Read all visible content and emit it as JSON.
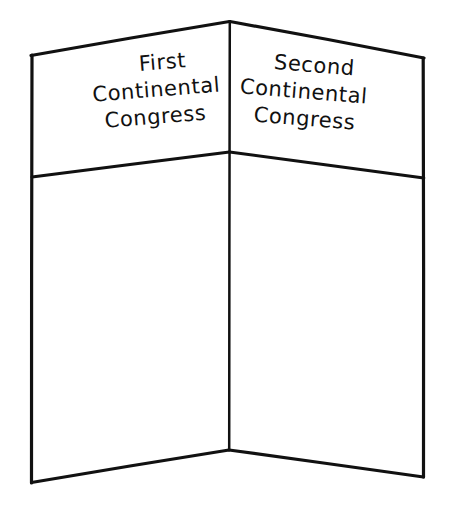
{
  "figure": {
    "style": "hand-drawn line art",
    "ink_color": "#111111",
    "background_color": "#ffffff"
  },
  "panels": [
    {
      "id": "left",
      "header_lines": [
        "First",
        "Continental",
        "Congress"
      ],
      "header_text": "First Continental Congress",
      "body_text": ""
    },
    {
      "id": "right",
      "header_lines": [
        "Second",
        "Continental",
        "Congress"
      ],
      "header_text": "Second Continental Congress",
      "body_text": ""
    }
  ],
  "geometry": {
    "apex": [
      230,
      21
    ],
    "top_left": [
      31,
      55
    ],
    "top_right": [
      424,
      58
    ],
    "bottom_center": [
      229,
      450
    ],
    "bottom_left": [
      31,
      483
    ],
    "bottom_right": [
      424,
      477
    ],
    "fold_x": 229,
    "divider_center_y": 152,
    "divider_left_y": 177,
    "divider_right_y": 178,
    "stroke_width_outline": 3.2,
    "stroke_width_fold": 2.4
  }
}
